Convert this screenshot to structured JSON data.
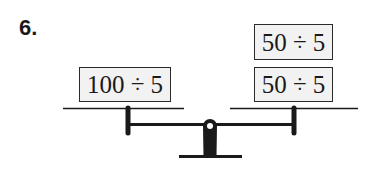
{
  "problem": {
    "number": "6."
  },
  "balance": {
    "left_pan": {
      "items": [
        {
          "expression": "100 ÷ 5"
        }
      ]
    },
    "right_pan": {
      "items": [
        {
          "expression": "50 ÷ 5"
        },
        {
          "expression": "50 ÷ 5"
        }
      ]
    },
    "colors": {
      "ink": "#1a1a1a",
      "box_fill": "#f2f2f2"
    }
  }
}
